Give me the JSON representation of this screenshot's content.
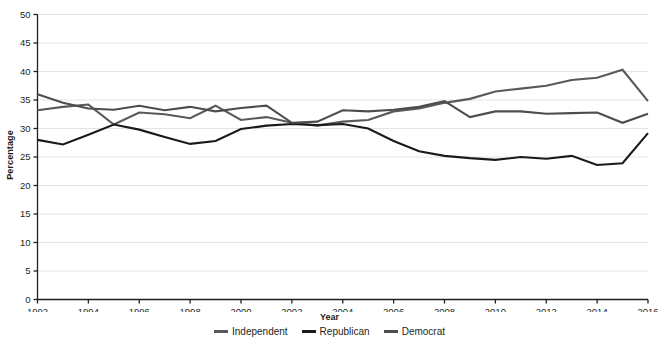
{
  "chart_data": {
    "type": "line",
    "title": "",
    "subtitle": "",
    "xlabel": "Year",
    "ylabel": "Percentage",
    "xlim": [
      1992,
      2016
    ],
    "ylim": [
      0,
      50
    ],
    "ytick_step": 5,
    "xtick_step": 2,
    "grid": true,
    "grid_axis": "y",
    "legend_position": "bottom-center",
    "x": [
      1992,
      1993,
      1994,
      1995,
      1996,
      1997,
      1998,
      1999,
      2000,
      2001,
      2002,
      2003,
      2004,
      2005,
      2006,
      2007,
      2008,
      2009,
      2010,
      2011,
      2012,
      2013,
      2014,
      2015,
      2016
    ],
    "xtick_labels": [
      "1992",
      "1994",
      "1996",
      "1998",
      "2000",
      "2002",
      "2004",
      "2006",
      "2008",
      "2010",
      "2012",
      "2014",
      "2016"
    ],
    "ytick_labels": [
      "0",
      "5",
      "10",
      "15",
      "20",
      "25",
      "30",
      "35",
      "40",
      "45",
      "50"
    ],
    "series": [
      {
        "name": "Independent",
        "color": "#595959",
        "values": [
          33.2,
          33.8,
          34.2,
          30.7,
          32.8,
          32.5,
          31.8,
          34.0,
          31.5,
          32.0,
          31.0,
          30.5,
          31.2,
          31.5,
          33.0,
          33.5,
          34.5,
          35.2,
          36.5,
          37.0,
          37.5,
          38.5,
          38.9,
          40.3,
          34.8
        ]
      },
      {
        "name": "Republican",
        "color": "#1a1a1a",
        "values": [
          28.0,
          27.2,
          28.9,
          30.7,
          29.8,
          28.5,
          27.3,
          27.8,
          29.9,
          30.5,
          30.8,
          30.6,
          30.8,
          30.0,
          27.8,
          26.0,
          25.2,
          24.8,
          24.5,
          25.0,
          24.7,
          25.2,
          23.6,
          23.9,
          29.2
        ]
      },
      {
        "name": "Democrat",
        "color": "#4d4d4d",
        "values": [
          36.0,
          34.5,
          33.5,
          33.3,
          34.0,
          33.2,
          33.8,
          33.0,
          33.6,
          34.0,
          31.0,
          31.2,
          33.2,
          33.0,
          33.3,
          33.8,
          34.8,
          32.0,
          33.0,
          33.0,
          32.6,
          32.7,
          32.8,
          31.0,
          32.6
        ]
      }
    ]
  },
  "axis": {
    "y_title": "Percentage",
    "x_title": "Year"
  },
  "legend": {
    "items": [
      {
        "label": "Independent"
      },
      {
        "label": "Republican"
      },
      {
        "label": "Democrat"
      }
    ]
  }
}
